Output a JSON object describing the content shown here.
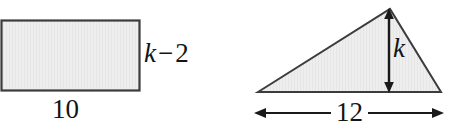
{
  "figure": {
    "background_color": "#ffffff",
    "shape_fill_color": "#ededed",
    "shape_stroke_color": "#3c3c3c",
    "text_color": "#141414",
    "shapes": [
      {
        "name": "rectangle",
        "type": "rectangle",
        "x": 1,
        "y": 20,
        "width": 139,
        "height": 71,
        "labels": {
          "width_label": "10",
          "height_label_variable": "k",
          "height_label_operator": "−",
          "height_label_term": "2"
        }
      },
      {
        "name": "triangle",
        "type": "triangle",
        "vertices": [
          [
            258,
            92
          ],
          [
            390,
            9
          ],
          [
            441,
            92
          ]
        ],
        "labels": {
          "height_label": "k",
          "base_label": "12"
        },
        "height_arrow": {
          "name": "height-dimension-arrow",
          "x": 389,
          "y_top": 11,
          "y_bottom": 91,
          "double_headed": true
        },
        "base_arrow": {
          "name": "base-dimension-arrow",
          "y": 113,
          "x_left": 255,
          "x_right": 443,
          "double_headed": true
        }
      }
    ]
  },
  "labels": {
    "rect_height_var": "k",
    "rect_height_op": "−",
    "rect_height_num": "2",
    "rect_width": "10",
    "tri_height": "k",
    "tri_base": "12"
  }
}
